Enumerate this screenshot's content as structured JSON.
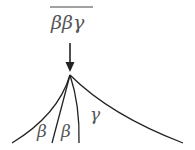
{
  "diagram": {
    "top_label": "ββγ",
    "top_label_overlined": true,
    "arrow": "down-arrow",
    "branches": [
      {
        "label": "β"
      },
      {
        "label": "β"
      },
      {
        "label": "γ"
      }
    ],
    "colors": {
      "line": "#222222",
      "text": "#555555"
    }
  }
}
